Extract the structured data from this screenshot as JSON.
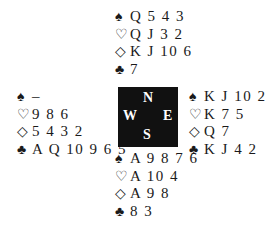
{
  "deal": {
    "north": {
      "spades": "Q 5 4 3",
      "hearts": "Q J 3 2",
      "diamonds": "K J 10 6",
      "clubs": "7"
    },
    "west": {
      "spades": "–",
      "hearts": "9 8 6",
      "diamonds": "5 4 3 2",
      "clubs": "A Q 10 9 6 5"
    },
    "east": {
      "spades": "K J 10 2",
      "hearts": "K 7 5",
      "diamonds": "Q 7",
      "clubs": "K J 4 2"
    },
    "south": {
      "spades": "A 9 8 7 6",
      "hearts": "A 10 4",
      "diamonds": "A 9 8",
      "clubs": "8 3"
    }
  },
  "icons": {
    "spade": "♠",
    "heart": "♡",
    "diamond": "◇",
    "club": "♣"
  },
  "compass": {
    "north": "N",
    "south": "S",
    "west": "W",
    "east": "E",
    "background": "#111111"
  }
}
